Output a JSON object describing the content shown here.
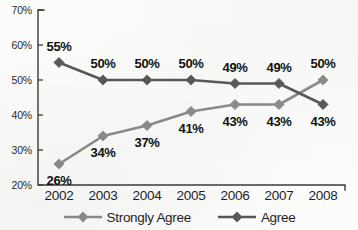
{
  "chart_data": {
    "type": "line",
    "title": "",
    "xlabel": "",
    "ylabel": "",
    "categories": [
      "2002",
      "2003",
      "2004",
      "2005",
      "2006",
      "2007",
      "2008"
    ],
    "ylim": [
      20,
      70
    ],
    "ytick_labels": [
      "70%",
      "60%",
      "50%",
      "40%",
      "30%",
      "20%"
    ],
    "ytick_values": [
      70,
      60,
      50,
      40,
      30,
      20
    ],
    "grid": false,
    "legend_position": "bottom",
    "value_labels": true,
    "value_label_suffix": "%",
    "series": [
      {
        "name": "Strongly Agree",
        "color": "#8c8c8c",
        "marker": "diamond",
        "values": [
          26,
          34,
          37,
          41,
          43,
          43,
          50
        ],
        "labels": [
          "26%",
          "34%",
          "37%",
          "41%",
          "43%",
          "43%",
          "50%"
        ],
        "label_positions": [
          "below",
          "below",
          "below",
          "below",
          "below",
          "below",
          "above"
        ]
      },
      {
        "name": "Agree",
        "color": "#595959",
        "marker": "diamond",
        "values": [
          55,
          50,
          50,
          50,
          49,
          49,
          43
        ],
        "labels": [
          "55%",
          "50%",
          "50%",
          "50%",
          "49%",
          "49%",
          "43%"
        ],
        "label_positions": [
          "above",
          "above",
          "above",
          "above",
          "above",
          "above",
          "below"
        ]
      }
    ]
  },
  "legend": {
    "items": [
      {
        "label": "Strongly Agree",
        "color": "#8c8c8c"
      },
      {
        "label": "Agree",
        "color": "#595959"
      }
    ]
  },
  "axis": {
    "line_color": "#3a3a3a"
  }
}
